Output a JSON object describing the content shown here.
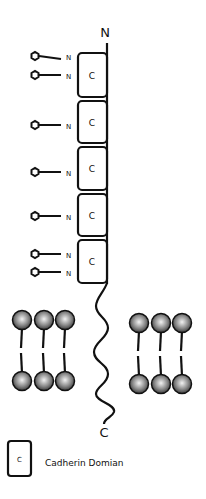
{
  "diagram": {
    "terminus_n_label": "N",
    "terminus_c_label": "C",
    "domain_letter": "C",
    "glycan_site_label": "N",
    "domain_count": 5,
    "glycan_sites_per_domain": [
      2,
      1,
      1,
      1,
      2
    ]
  },
  "legend": {
    "symbol_letter": "C",
    "label": "Cadherin Domian"
  },
  "colors": {
    "stroke": "#111111",
    "lipid_head_light": "#f2f2f2",
    "lipid_head_dark": "#2a2a2a"
  }
}
